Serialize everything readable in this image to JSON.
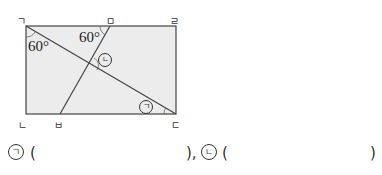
{
  "figure": {
    "fill_color": "#ececec",
    "stroke_color": "#444444",
    "vertices": {
      "top_left": "ㄱ",
      "top_mid": "ㅁ",
      "top_right": "ㄹ",
      "bottom_left": "ㄴ",
      "bottom_mid": "ㅂ",
      "bottom_right": "ㄷ"
    },
    "angles": {
      "at_top_left": "60°",
      "at_top_mid": "60°"
    },
    "unknown_marks": {
      "first": "ㄱ",
      "second": "ㄴ"
    }
  },
  "answer": {
    "first_mark": "ㄱ",
    "first_open": "(",
    "first_close": "),",
    "second_mark": "ㄴ",
    "second_open": "(",
    "second_close": ")"
  }
}
